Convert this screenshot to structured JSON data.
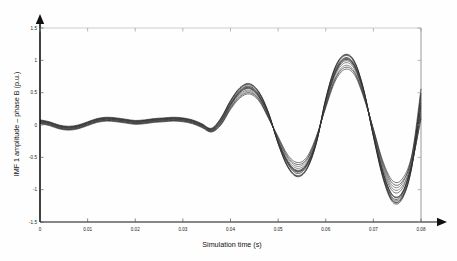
{
  "chart_data": {
    "type": "line",
    "title": "",
    "xlabel": "Simulation time (s)",
    "ylabel": "IMF 1 amplitude – phase B (p.u.)",
    "xlim": [
      0,
      0.08
    ],
    "ylim": [
      -1.5,
      1.5
    ],
    "grid": true,
    "grid_axes": "box-border only",
    "legend": "none",
    "xticks": [
      0,
      0.01,
      0.02,
      0.03,
      0.04,
      0.05,
      0.06,
      0.07,
      0.08
    ],
    "xticklabels": [
      "0",
      "0.01",
      "0.02",
      "0.03",
      "0.04",
      "0.05",
      "0.06",
      "0.07",
      "0.08"
    ],
    "yticks": [
      -1.5,
      -1,
      -0.5,
      0,
      0.5,
      1,
      1.5
    ],
    "yticklabels": [
      "-1.5",
      "-1",
      "-0.5",
      "0",
      "0.5",
      "1",
      "1.5"
    ],
    "line_color": "#3a3a3a",
    "n_series": 12,
    "x": [
      0,
      0.002,
      0.004,
      0.006,
      0.008,
      0.01,
      0.012,
      0.014,
      0.016,
      0.018,
      0.02,
      0.022,
      0.024,
      0.026,
      0.028,
      0.03,
      0.032,
      0.034,
      0.036,
      0.038,
      0.04,
      0.042,
      0.044,
      0.046,
      0.048,
      0.05,
      0.052,
      0.054,
      0.056,
      0.058,
      0.06,
      0.062,
      0.064,
      0.066,
      0.068,
      0.07,
      0.072,
      0.074,
      0.076,
      0.078,
      0.08
    ],
    "series": [
      {
        "name": "run-01",
        "values": [
          0.05,
          0.02,
          -0.03,
          -0.05,
          -0.03,
          0.02,
          0.07,
          0.09,
          0.08,
          0.06,
          0.04,
          0.05,
          0.07,
          0.08,
          0.09,
          0.08,
          0.05,
          -0.01,
          -0.08,
          0.06,
          0.32,
          0.52,
          0.58,
          0.45,
          0.15,
          -0.25,
          -0.58,
          -0.72,
          -0.62,
          -0.25,
          0.35,
          0.82,
          1.02,
          0.92,
          0.5,
          -0.12,
          -0.72,
          -1.08,
          -1.05,
          -0.62,
          0.1
        ]
      },
      {
        "name": "run-02",
        "values": [
          0.06,
          0.03,
          -0.02,
          -0.04,
          -0.02,
          0.03,
          0.08,
          0.1,
          0.09,
          0.07,
          0.05,
          0.06,
          0.08,
          0.09,
          0.1,
          0.09,
          0.06,
          0.0,
          -0.07,
          0.08,
          0.34,
          0.54,
          0.6,
          0.47,
          0.16,
          -0.26,
          -0.6,
          -0.75,
          -0.64,
          -0.26,
          0.37,
          0.85,
          1.04,
          0.94,
          0.51,
          -0.14,
          -0.75,
          -1.12,
          -1.08,
          -0.64,
          0.14
        ]
      },
      {
        "name": "run-03",
        "values": [
          0.04,
          0.01,
          -0.04,
          -0.06,
          -0.04,
          0.01,
          0.06,
          0.08,
          0.07,
          0.05,
          0.03,
          0.04,
          0.06,
          0.07,
          0.08,
          0.07,
          0.04,
          -0.02,
          -0.09,
          0.04,
          0.3,
          0.5,
          0.56,
          0.43,
          0.14,
          -0.24,
          -0.56,
          -0.7,
          -0.6,
          -0.24,
          0.33,
          0.79,
          0.99,
          0.89,
          0.48,
          -0.1,
          -0.68,
          -1.02,
          -0.99,
          -0.58,
          0.18
        ]
      },
      {
        "name": "run-04",
        "values": [
          0.07,
          0.04,
          -0.01,
          -0.03,
          -0.01,
          0.04,
          0.09,
          0.11,
          0.1,
          0.08,
          0.06,
          0.07,
          0.09,
          0.1,
          0.11,
          0.1,
          0.07,
          0.01,
          -0.06,
          0.09,
          0.36,
          0.56,
          0.62,
          0.49,
          0.18,
          -0.28,
          -0.63,
          -0.78,
          -0.67,
          -0.28,
          0.39,
          0.88,
          1.07,
          0.97,
          0.53,
          -0.16,
          -0.79,
          -1.16,
          -1.12,
          -0.66,
          0.22
        ]
      },
      {
        "name": "run-05",
        "values": [
          0.03,
          0.0,
          -0.05,
          -0.07,
          -0.05,
          0.0,
          0.05,
          0.07,
          0.06,
          0.04,
          0.02,
          0.03,
          0.05,
          0.06,
          0.07,
          0.06,
          0.03,
          -0.03,
          -0.1,
          0.02,
          0.27,
          0.46,
          0.52,
          0.4,
          0.12,
          -0.21,
          -0.51,
          -0.64,
          -0.55,
          -0.21,
          0.3,
          0.73,
          0.92,
          0.83,
          0.45,
          -0.08,
          -0.62,
          -0.94,
          -0.91,
          -0.53,
          0.26
        ]
      },
      {
        "name": "run-06",
        "values": [
          0.05,
          0.02,
          -0.03,
          -0.05,
          -0.03,
          0.02,
          0.07,
          0.09,
          0.08,
          0.06,
          0.04,
          0.05,
          0.07,
          0.08,
          0.09,
          0.08,
          0.05,
          -0.01,
          -0.08,
          0.05,
          0.31,
          0.51,
          0.57,
          0.44,
          0.15,
          -0.25,
          -0.57,
          -0.71,
          -0.61,
          -0.25,
          0.34,
          0.81,
          1.01,
          0.91,
          0.49,
          -0.13,
          -0.73,
          -1.09,
          -1.06,
          -0.61,
          0.3
        ]
      },
      {
        "name": "run-07",
        "values": [
          0.08,
          0.05,
          0.0,
          -0.02,
          0.0,
          0.05,
          0.1,
          0.12,
          0.11,
          0.09,
          0.07,
          0.08,
          0.1,
          0.11,
          0.12,
          0.11,
          0.08,
          0.02,
          -0.05,
          0.11,
          0.38,
          0.58,
          0.64,
          0.51,
          0.19,
          -0.29,
          -0.65,
          -0.8,
          -0.69,
          -0.29,
          0.41,
          0.9,
          1.09,
          0.99,
          0.54,
          -0.18,
          -0.82,
          -1.19,
          -1.15,
          -0.68,
          0.34
        ]
      },
      {
        "name": "run-08",
        "values": [
          0.02,
          -0.01,
          -0.06,
          -0.08,
          -0.06,
          -0.01,
          0.04,
          0.06,
          0.05,
          0.03,
          0.01,
          0.02,
          0.04,
          0.05,
          0.06,
          0.05,
          0.02,
          -0.04,
          -0.11,
          0.0,
          0.24,
          0.42,
          0.48,
          0.37,
          0.1,
          -0.18,
          -0.46,
          -0.58,
          -0.5,
          -0.18,
          0.27,
          0.68,
          0.86,
          0.78,
          0.42,
          -0.06,
          -0.56,
          -0.86,
          -0.84,
          -0.49,
          0.38
        ]
      },
      {
        "name": "run-09",
        "values": [
          0.06,
          0.03,
          -0.02,
          -0.04,
          -0.02,
          0.03,
          0.08,
          0.1,
          0.09,
          0.07,
          0.05,
          0.06,
          0.08,
          0.09,
          0.1,
          0.09,
          0.06,
          0.0,
          -0.07,
          0.07,
          0.33,
          0.53,
          0.59,
          0.46,
          0.16,
          -0.26,
          -0.59,
          -0.73,
          -0.63,
          -0.26,
          0.36,
          0.84,
          1.03,
          0.93,
          0.5,
          -0.15,
          -0.77,
          -1.14,
          -1.1,
          -0.65,
          0.42
        ]
      },
      {
        "name": "run-10",
        "values": [
          0.04,
          0.01,
          -0.04,
          -0.06,
          -0.04,
          0.01,
          0.06,
          0.08,
          0.07,
          0.05,
          0.03,
          0.04,
          0.06,
          0.07,
          0.08,
          0.07,
          0.04,
          -0.02,
          -0.09,
          0.03,
          0.29,
          0.48,
          0.54,
          0.42,
          0.13,
          -0.23,
          -0.54,
          -0.67,
          -0.58,
          -0.23,
          0.32,
          0.77,
          0.96,
          0.87,
          0.47,
          -0.09,
          -0.65,
          -0.98,
          -0.95,
          -0.56,
          0.46
        ]
      },
      {
        "name": "run-11",
        "values": [
          0.07,
          0.04,
          -0.01,
          -0.03,
          -0.01,
          0.04,
          0.09,
          0.11,
          0.1,
          0.08,
          0.06,
          0.07,
          0.09,
          0.1,
          0.11,
          0.1,
          0.07,
          0.01,
          -0.06,
          0.1,
          0.37,
          0.57,
          0.63,
          0.5,
          0.18,
          -0.28,
          -0.64,
          -0.79,
          -0.68,
          -0.28,
          0.4,
          0.89,
          1.08,
          0.98,
          0.53,
          -0.17,
          -0.8,
          -1.17,
          -1.13,
          -0.67,
          0.5
        ]
      },
      {
        "name": "run-12",
        "values": [
          0.03,
          0.0,
          -0.05,
          -0.07,
          -0.05,
          0.0,
          0.05,
          0.07,
          0.06,
          0.04,
          0.02,
          0.03,
          0.05,
          0.06,
          0.07,
          0.06,
          0.03,
          -0.03,
          -0.1,
          0.01,
          0.26,
          0.44,
          0.5,
          0.39,
          0.11,
          -0.2,
          -0.49,
          -0.61,
          -0.53,
          -0.2,
          0.29,
          0.71,
          0.89,
          0.81,
          0.44,
          -0.07,
          -0.59,
          -0.9,
          -0.88,
          -0.51,
          0.56
        ]
      }
    ]
  }
}
